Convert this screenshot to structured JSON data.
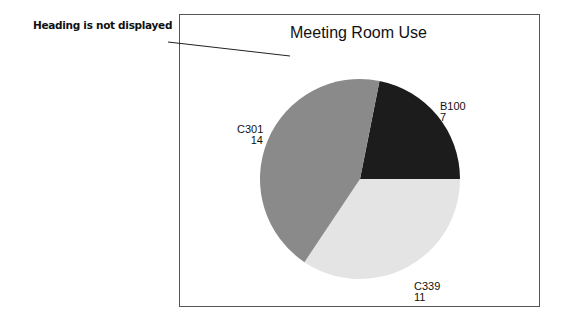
{
  "annotation": {
    "text": "Heading is not displayed"
  },
  "chart_data": {
    "type": "pie",
    "title": "Meeting Room Use",
    "categories": [
      "B100",
      "C339",
      "C301"
    ],
    "values": [
      7,
      11,
      14
    ],
    "colors": [
      "#1c1c1c",
      "#e4e4e4",
      "#8a8a8a"
    ],
    "labels": [
      {
        "name": "B100",
        "value": "7"
      },
      {
        "name": "C339",
        "value": "11"
      },
      {
        "name": "C301",
        "value": "14"
      }
    ],
    "legend": "none",
    "xlabel": "",
    "ylabel": ""
  }
}
